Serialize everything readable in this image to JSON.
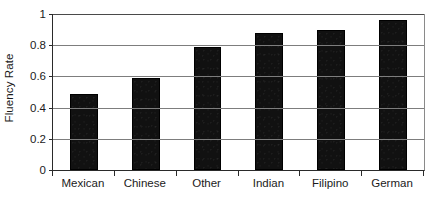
{
  "chart_data": {
    "type": "bar",
    "title": "",
    "xlabel": "",
    "ylabel": "Fluency Rate",
    "categories": [
      "Mexican",
      "Chinese",
      "Other",
      "Indian",
      "Filipino",
      "German"
    ],
    "values": [
      0.49,
      0.59,
      0.79,
      0.88,
      0.9,
      0.96
    ],
    "series": [
      {
        "name": "Fluency Rate",
        "values": [
          0.49,
          0.59,
          0.79,
          0.88,
          0.9,
          0.96
        ]
      }
    ],
    "ylim": [
      0,
      1
    ],
    "ytick_labels": [
      "0",
      "0.2",
      "0.4",
      "0.6",
      "0.8",
      "1"
    ],
    "ytick_values": [
      0,
      0.2,
      0.4,
      0.6,
      0.8,
      1
    ],
    "grid": "horizontal",
    "legend": "none",
    "bar_color": "#111111",
    "gridline_color": "#7d7d7d",
    "axis_color": "#2a2a2a",
    "background_color": "#ffffff"
  }
}
